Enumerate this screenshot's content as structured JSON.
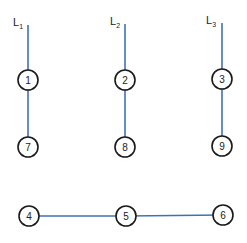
{
  "diagram": {
    "lines": [
      {
        "id": "L1",
        "label": "L",
        "subscript": "1",
        "x": 28,
        "y_top": 25,
        "y_bottom": 147,
        "label_x": 13,
        "label_y": 26
      },
      {
        "id": "L2",
        "label": "L",
        "subscript": "2",
        "x": 125,
        "y_top": 24,
        "y_bottom": 147,
        "label_x": 110,
        "label_y": 25
      },
      {
        "id": "L3",
        "label": "L",
        "subscript": "3",
        "x": 222,
        "y_top": 23,
        "y_bottom": 146,
        "label_x": 206,
        "label_y": 24
      }
    ],
    "nodes": [
      {
        "id": "1",
        "label": "1",
        "x": 28,
        "y": 80
      },
      {
        "id": "2",
        "label": "2",
        "x": 125,
        "y": 80
      },
      {
        "id": "3",
        "label": "3",
        "x": 222,
        "y": 79
      },
      {
        "id": "7",
        "label": "7",
        "x": 28,
        "y": 147
      },
      {
        "id": "8",
        "label": "8",
        "x": 125,
        "y": 147
      },
      {
        "id": "9",
        "label": "9",
        "x": 222,
        "y": 146
      },
      {
        "id": "4",
        "label": "4",
        "x": 29,
        "y": 216
      },
      {
        "id": "5",
        "label": "5",
        "x": 126,
        "y": 216
      },
      {
        "id": "6",
        "label": "6",
        "x": 223,
        "y": 215
      }
    ],
    "edges": [
      {
        "from": "4",
        "to": "5"
      },
      {
        "from": "5",
        "to": "6"
      }
    ],
    "node_radius": 10,
    "colors": {
      "edge": "#3f72b5",
      "node_stroke": "#1a1a1a",
      "background": "#ffffff"
    }
  }
}
